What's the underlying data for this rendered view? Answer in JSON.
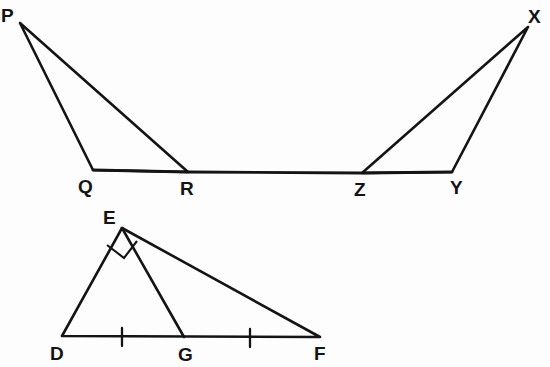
{
  "figure": {
    "background_color": "#fdfdfd",
    "stroke_color": "#141414",
    "width": 550,
    "height": 367
  },
  "labels": {
    "p": "P",
    "q": "Q",
    "r": "R",
    "x": "X",
    "y": "Y",
    "z": "Z",
    "e": "E",
    "d": "D",
    "g": "G",
    "f": "F"
  },
  "label_positions": {
    "p": {
      "x": 1,
      "y": 22
    },
    "q": {
      "x": 78,
      "y": 193
    },
    "r": {
      "x": 180,
      "y": 195
    },
    "x": {
      "x": 528,
      "y": 23
    },
    "y": {
      "x": 450,
      "y": 194
    },
    "z": {
      "x": 354,
      "y": 196
    },
    "e": {
      "x": 103,
      "y": 224
    },
    "d": {
      "x": 50,
      "y": 360
    },
    "g": {
      "x": 178,
      "y": 361
    },
    "f": {
      "x": 314,
      "y": 360
    }
  },
  "points": {
    "P": {
      "x": 20,
      "y": 23
    },
    "Q": {
      "x": 93,
      "y": 170
    },
    "R": {
      "x": 188,
      "y": 172
    },
    "Z": {
      "x": 362,
      "y": 173
    },
    "Y": {
      "x": 452,
      "y": 172
    },
    "X": {
      "x": 528,
      "y": 27
    },
    "E": {
      "x": 122,
      "y": 228
    },
    "D": {
      "x": 62,
      "y": 336
    },
    "G": {
      "x": 184,
      "y": 337
    },
    "F": {
      "x": 320,
      "y": 337
    }
  },
  "shapes": {
    "triangle_pqr": {
      "name": "triangle-PQR",
      "path": "M 20 23 L 93 170 L 188 172 Z",
      "stroke_width": 2.6
    },
    "triangle_xyz": {
      "name": "triangle-XYZ",
      "path": "M 528 27 L 362 173 L 452 172 Z",
      "stroke_width": 2.6
    },
    "baseline_qy": {
      "name": "baseline-Q-to-Y",
      "path": "M 93 170 L 188 172 L 362 173 L 452 172",
      "stroke_width": 2.8
    },
    "triangle_def": {
      "name": "triangle-DEF",
      "path": "M 122 228 L 62 336 L 320 337 Z",
      "stroke_width": 2.6
    },
    "cevian_eg": {
      "name": "segment-EG",
      "path": "M 122 228 L 184 337",
      "stroke_width": 2.6
    }
  },
  "marks": {
    "right_angle_at_e": {
      "name": "right-angle-marker-E",
      "path": "M 107 245 L 124 258 L 137 241"
    },
    "tick_dg": {
      "name": "congruence-tick-DG",
      "path": "M 122 328 L 122 346"
    },
    "tick_gf": {
      "name": "congruence-tick-GF",
      "path": "M 250 329 L 250 347"
    }
  }
}
